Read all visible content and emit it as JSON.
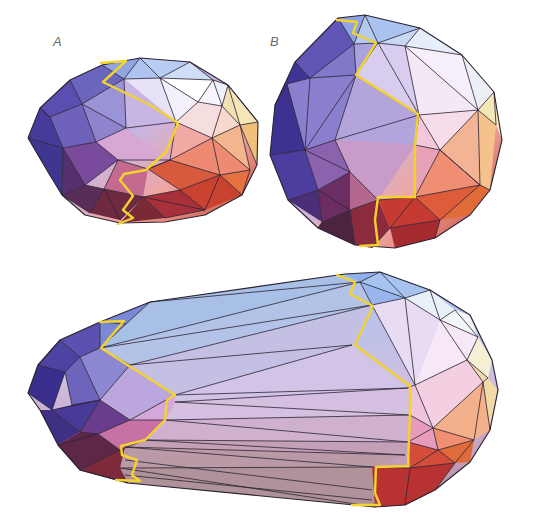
{
  "figure": {
    "panels": [
      {
        "id": "A",
        "label": "A",
        "description": "Near-spherical convex polyhedron with yellow seam path"
      },
      {
        "id": "B",
        "label": "B",
        "description": "Rounder convex polyhedron with yellow seam path"
      },
      {
        "id": "C",
        "label": "",
        "description": "Elongated capsule polyhedron with two yellow seam paths joined by long triangular strips"
      }
    ],
    "caption_visible": false,
    "colors": {
      "seam": "#f2d22e",
      "edge": "#2b2433",
      "cool_top": "#a9c2ee",
      "violet": "#4b3d97",
      "lavender": "#c9b6e6",
      "pink": "#e8a9c4",
      "orange": "#e8693a",
      "dark_red": "#7a2a32",
      "pale_yellow": "#f3e7b8"
    }
  }
}
